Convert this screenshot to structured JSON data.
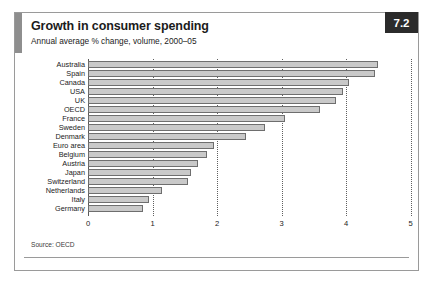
{
  "figure": {
    "badge": "7.2",
    "title": "Growth in consumer spending",
    "subtitle": "Annual average % change, volume, 2000–05",
    "source": "Source: OECD"
  },
  "chart_data": {
    "type": "bar",
    "orientation": "horizontal",
    "title": "Growth in consumer spending",
    "subtitle": "Annual average % change, volume, 2000–05",
    "xlabel": "",
    "ylabel": "",
    "xlim": [
      0,
      5
    ],
    "xticks": [
      0,
      1,
      2,
      3,
      4,
      5
    ],
    "xtick_labels": [
      "0",
      "1",
      "2",
      "3",
      "4",
      "5"
    ],
    "grid": "vertical-dotted",
    "legend": "none",
    "source": "Source: OECD",
    "bar_color": "#c9c9c9",
    "bar_edge_color": "#6e6e6e",
    "categories": [
      "Australia",
      "Spain",
      "Canada",
      "USA",
      "UK",
      "OECD",
      "France",
      "Sweden",
      "Denmark",
      "Euro area",
      "Belgium",
      "Austria",
      "Japan",
      "Switzerland",
      "Netherlands",
      "Italy",
      "Germany"
    ],
    "values": [
      4.5,
      4.45,
      4.05,
      3.95,
      3.85,
      3.6,
      3.05,
      2.75,
      2.45,
      1.95,
      1.85,
      1.7,
      1.6,
      1.55,
      1.15,
      0.95,
      0.85
    ]
  }
}
